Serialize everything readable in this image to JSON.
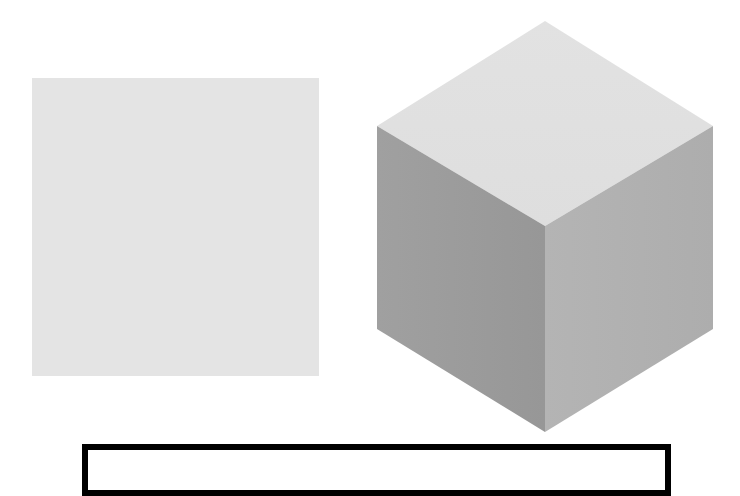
{
  "figure": {
    "flat_square": {
      "shape": "square",
      "fill": "#e4e4e4",
      "bounds": {
        "x": 32,
        "y": 78,
        "width": 287,
        "height": 298
      }
    },
    "cube": {
      "shape": "isometric-cube",
      "vertices": {
        "top": [
          545,
          21
        ],
        "upper_left": [
          377,
          126
        ],
        "upper_right": [
          713,
          126
        ],
        "center": [
          545,
          226
        ],
        "lower_left": [
          377,
          329
        ],
        "lower_right": [
          713,
          329
        ],
        "bottom": [
          545,
          432
        ]
      },
      "faces": {
        "top": {
          "fill": "#e0e0e0"
        },
        "left": {
          "fill": "#9c9c9c"
        },
        "right": {
          "fill": "#b0b0b0"
        }
      }
    },
    "outline_box": {
      "shape": "rectangle",
      "stroke": "#000000",
      "stroke_width": 6,
      "bounds": {
        "x": 82,
        "y": 444,
        "width": 589,
        "height": "cropped"
      }
    }
  }
}
